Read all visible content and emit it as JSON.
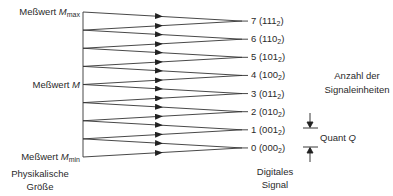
{
  "left_labels": {
    "max": {
      "prefix": "Meßwert",
      "symbol": "M",
      "subscript": "max"
    },
    "mid": {
      "prefix": "Meßwert",
      "symbol": "M"
    },
    "min": {
      "prefix": "Meßwert",
      "symbol": "M",
      "subscript": "min"
    },
    "axis_title_line1": "Physikalische",
    "axis_title_line2": "Größe"
  },
  "levels": [
    {
      "value": "7",
      "binary": "111",
      "base": "2"
    },
    {
      "value": "6",
      "binary": "110",
      "base": "2"
    },
    {
      "value": "5",
      "binary": "101",
      "base": "2"
    },
    {
      "value": "4",
      "binary": "100",
      "base": "2"
    },
    {
      "value": "3",
      "binary": "011",
      "base": "2"
    },
    {
      "value": "2",
      "binary": "010",
      "base": "2"
    },
    {
      "value": "1",
      "binary": "001",
      "base": "2"
    },
    {
      "value": "0",
      "binary": "000",
      "base": "2"
    }
  ],
  "right_labels": {
    "count_line1": "Anzahl der",
    "count_line2": "Signaleinheiten",
    "quant_prefix": "Quant",
    "quant_symbol": "Q",
    "output_title_line1": "Digitales",
    "output_title_line2": "Signal"
  },
  "colors": {
    "line": "#333333",
    "text": "#2a2a2a"
  }
}
